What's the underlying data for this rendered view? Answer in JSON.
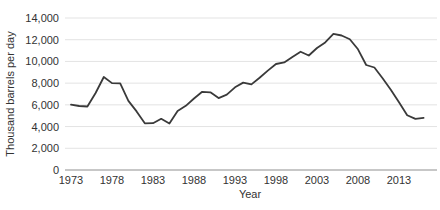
{
  "chart_data": {
    "type": "line",
    "title": "",
    "xlabel": "Year",
    "ylabel": "Thousand barrels per day",
    "x": [
      1973,
      1974,
      1975,
      1976,
      1977,
      1978,
      1979,
      1980,
      1981,
      1982,
      1983,
      1984,
      1985,
      1986,
      1987,
      1988,
      1989,
      1990,
      1991,
      1992,
      1993,
      1994,
      1995,
      1996,
      1997,
      1998,
      1999,
      2000,
      2001,
      2002,
      2003,
      2004,
      2005,
      2006,
      2007,
      2008,
      2009,
      2010,
      2011,
      2012,
      2013,
      2014,
      2015,
      2016
    ],
    "values": [
      6025,
      5892,
      5846,
      7090,
      8565,
      8002,
      7985,
      6365,
      5401,
      4298,
      4312,
      4715,
      4286,
      5439,
      5914,
      6587,
      7202,
      7161,
      6626,
      6938,
      7618,
      8054,
      7886,
      8498,
      9158,
      9764,
      9912,
      10419,
      10900,
      10546,
      11238,
      11757,
      12549,
      12390,
      12036,
      11114,
      9667,
      9441,
      8454,
      7393,
      6237,
      5041,
      4711,
      4795
    ],
    "ylim": [
      0,
      14000
    ],
    "xlim": [
      1973,
      2016
    ],
    "grid": true,
    "legend": "none",
    "yticks": [
      {
        "value": 0,
        "label": "0"
      },
      {
        "value": 2000,
        "label": "2,000"
      },
      {
        "value": 4000,
        "label": "4,000"
      },
      {
        "value": 6000,
        "label": "6,000"
      },
      {
        "value": 8000,
        "label": "8,000"
      },
      {
        "value": 10000,
        "label": "10,000"
      },
      {
        "value": 12000,
        "label": "12,000"
      },
      {
        "value": 14000,
        "label": "14,000"
      }
    ],
    "xticks": [
      {
        "value": 1973,
        "label": "1973"
      },
      {
        "value": 1978,
        "label": "1978"
      },
      {
        "value": 1983,
        "label": "1983"
      },
      {
        "value": 1988,
        "label": "1988"
      },
      {
        "value": 1993,
        "label": "1993"
      },
      {
        "value": 1998,
        "label": "1998"
      },
      {
        "value": 2003,
        "label": "2003"
      },
      {
        "value": 2008,
        "label": "2008"
      },
      {
        "value": 2013,
        "label": "2013"
      }
    ],
    "colors": {
      "line": "#3a3a3a",
      "grid": "#e3e3e3",
      "axis": "#8f8f8f",
      "text": "#333333",
      "background": "#ffffff"
    }
  }
}
